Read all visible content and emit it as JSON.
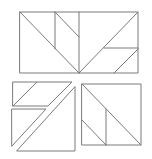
{
  "diagram": {
    "title": "",
    "stroke_color": "#7a7a7a",
    "background": "#ffffff",
    "figures": [
      {
        "name": "top-rectangle",
        "outline": [
          [
            20,
            12
          ],
          [
            138,
            12
          ],
          [
            138,
            73
          ],
          [
            20,
            73
          ]
        ],
        "lines": [
          [
            [
              20,
              12
            ],
            [
              79,
              73
            ]
          ],
          [
            [
              55,
              12
            ],
            [
              55,
              49
            ]
          ],
          [
            [
              55,
              12
            ],
            [
              79,
              37
            ]
          ],
          [
            [
              79,
              12
            ],
            [
              79,
              73
            ]
          ],
          [
            [
              79,
              73
            ],
            [
              138,
              12
            ]
          ],
          [
            [
              104,
              48
            ],
            [
              138,
              48
            ]
          ],
          [
            [
              114,
              73
            ],
            [
              138,
              49
            ]
          ]
        ]
      },
      {
        "name": "bottom-left-pieces",
        "polygons": [
          [
            [
              13,
              82
            ],
            [
              72,
              82
            ],
            [
              48,
              106
            ],
            [
              13,
              106
            ]
          ],
          [
            [
              12,
              109
            ],
            [
              46,
              109
            ],
            [
              12,
              146
            ]
          ],
          [
            [
              75,
              87
            ],
            [
              75,
              151
            ],
            [
              17,
              151
            ]
          ]
        ],
        "lines": [
          [
            [
              37,
              82
            ],
            [
              13,
              106
            ]
          ]
        ]
      },
      {
        "name": "bottom-right-square",
        "outline": [
          [
            82,
            84
          ],
          [
            141,
            84
          ],
          [
            141,
            145
          ],
          [
            82,
            145
          ]
        ],
        "lines": [
          [
            [
              82,
              84
            ],
            [
              141,
              145
            ]
          ],
          [
            [
              106,
              109
            ],
            [
              106,
              145
            ]
          ],
          [
            [
              82,
              120
            ],
            [
              106,
              145
            ]
          ]
        ]
      }
    ]
  }
}
